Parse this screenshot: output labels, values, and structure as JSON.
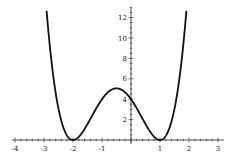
{
  "chart_data": {
    "type": "line",
    "title": "",
    "xlabel": "",
    "ylabel": "",
    "function": "(x+2)^2 (x-1)^2",
    "xlim": [
      -4.1,
      3.2
    ],
    "ylim": [
      0,
      13
    ],
    "x_ticks": [
      -4,
      -3,
      -2,
      -1,
      1,
      2,
      3
    ],
    "x_tick_labels": [
      "-4",
      "-3",
      "-2",
      "-1",
      "1",
      "2",
      "3"
    ],
    "y_ticks": [
      2,
      4,
      6,
      8,
      10,
      12
    ],
    "y_tick_labels": [
      "2",
      "4",
      "6",
      "8",
      "10",
      "12"
    ],
    "grid": false,
    "legend": "none",
    "series": [
      {
        "name": "f(x)",
        "x": [
          -3.0,
          -2.9,
          -2.8,
          -2.7,
          -2.6,
          -2.5,
          -2.4,
          -2.3,
          -2.2,
          -2.1,
          -2.0,
          -1.9,
          -1.8,
          -1.7,
          -1.6,
          -1.5,
          -1.4,
          -1.3,
          -1.2,
          -1.1,
          -1.0,
          -0.9,
          -0.8,
          -0.7,
          -0.6,
          -0.5,
          -0.4,
          -0.3,
          -0.2,
          -0.1,
          0.0,
          0.1,
          0.2,
          0.3,
          0.4,
          0.5,
          0.6,
          0.7,
          0.8,
          0.9,
          1.0,
          1.1,
          1.2,
          1.3,
          1.4,
          1.5,
          1.6,
          1.7,
          1.8,
          1.9,
          2.0
        ],
        "y": [
          16.0,
          12.6,
          9.6,
          7.2,
          5.2,
          3.5,
          2.3,
          1.4,
          0.7,
          0.2,
          0.0,
          0.1,
          0.3,
          0.7,
          1.1,
          1.6,
          2.2,
          2.7,
          3.3,
          3.8,
          4.0,
          4.5,
          4.8,
          5.0,
          5.0,
          5.06,
          5.0,
          4.9,
          4.6,
          4.3,
          4.0,
          3.5,
          3.0,
          2.6,
          2.1,
          1.6,
          1.1,
          0.7,
          0.3,
          0.1,
          0.0,
          0.1,
          0.4,
          0.9,
          1.6,
          3.1,
          4.8,
          6.9,
          9.6,
          12.8,
          16.0
        ]
      }
    ]
  }
}
